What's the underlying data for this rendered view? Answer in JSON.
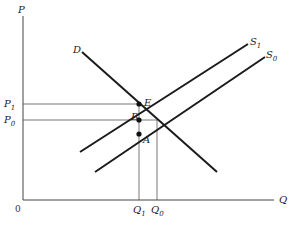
{
  "diagram": {
    "type": "supply-demand",
    "axes": {
      "y_label": "P",
      "x_label": "Q",
      "origin_label": "0"
    },
    "curves": [
      {
        "name": "D",
        "label": "D",
        "subscript": ""
      },
      {
        "name": "S1",
        "label": "S",
        "subscript": "1"
      },
      {
        "name": "S0",
        "label": "S",
        "subscript": "0"
      }
    ],
    "price_levels": [
      {
        "label": "P",
        "subscript": "1"
      },
      {
        "label": "P",
        "subscript": "0"
      }
    ],
    "quantity_levels": [
      {
        "label": "Q",
        "subscript": "1"
      },
      {
        "label": "Q",
        "subscript": "0"
      }
    ],
    "points": [
      {
        "label": "E"
      },
      {
        "label": "B"
      },
      {
        "label": "A"
      }
    ],
    "colors": {
      "curve": "#1a1a1a",
      "guide": "#555555",
      "axis": "#444444"
    }
  }
}
